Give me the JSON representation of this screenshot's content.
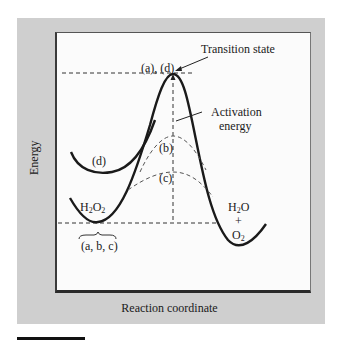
{
  "diagram": {
    "type": "reaction-energy-profile",
    "axes": {
      "ylabel": "Energy",
      "xlabel": "Reaction coordinate"
    },
    "labels": {
      "transition_state": "Transition state",
      "peak_label": "(a), (d)",
      "activation_line1": "Activation",
      "activation_line2": "energy",
      "curve_b": "(b)",
      "curve_c": "(c)",
      "curve_d": "(d)",
      "reactant_main": "H",
      "reactant_sub1": "2",
      "reactant_mid": "O",
      "reactant_sub2": "2",
      "reactant_group": "(a, b, c)",
      "product_h2o_h": "H",
      "product_h2o_sub": "2",
      "product_h2o_o": "O",
      "product_plus": "+",
      "product_o2_o": "O",
      "product_o2_sub": "2"
    },
    "curves": [
      {
        "name": "(a)",
        "style": "solid",
        "description": "uncatalyzed, highest peak from H2O2 minimum"
      },
      {
        "name": "(b)",
        "style": "dashed",
        "description": "catalyzed, medium peak"
      },
      {
        "name": "(c)",
        "style": "dashed",
        "description": "catalyzed, lowest peak"
      },
      {
        "name": "(d)",
        "style": "solid",
        "description": "higher starting energy, same peak as (a)"
      }
    ],
    "colors": {
      "panel": "#cfcfcf",
      "plot": "#fbfbfb",
      "ink": "#1a1a1a"
    }
  }
}
